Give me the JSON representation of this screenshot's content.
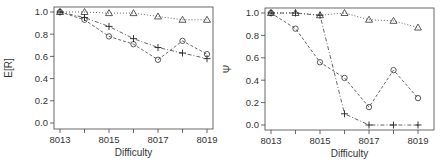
{
  "chart_data": [
    {
      "type": "line",
      "title": "",
      "xlabel": "Difficulty",
      "ylabel": "E[R]",
      "x": [
        8013,
        8014,
        8015,
        8016,
        8017,
        8018,
        8019
      ],
      "x_tick_labels": [
        "8013",
        "8015",
        "8017",
        "8019"
      ],
      "y_tick_labels": [
        "0.0",
        "0.2",
        "0.4",
        "0.6",
        "0.8",
        "1.0"
      ],
      "ylim": [
        0,
        1
      ],
      "grid": false,
      "legend": null,
      "series": [
        {
          "name": "triangle",
          "marker": "triangle",
          "linestyle": "dotted",
          "values": [
            1.0,
            1.0,
            0.99,
            0.99,
            0.96,
            0.93,
            0.93
          ]
        },
        {
          "name": "circle",
          "marker": "circle",
          "linestyle": "dashed",
          "values": [
            1.0,
            0.93,
            0.78,
            0.71,
            0.57,
            0.74,
            0.62
          ]
        },
        {
          "name": "plus",
          "marker": "plus",
          "linestyle": "dashdot",
          "values": [
            1.0,
            0.95,
            0.87,
            0.76,
            0.68,
            0.63,
            0.58
          ]
        }
      ]
    },
    {
      "type": "line",
      "title": "",
      "xlabel": "Difficulty",
      "ylabel": "Ψ",
      "x": [
        8013,
        8014,
        8015,
        8016,
        8017,
        8018,
        8019
      ],
      "x_tick_labels": [
        "8013",
        "8015",
        "8017",
        "8019"
      ],
      "y_tick_labels": [
        "0.0",
        "0.2",
        "0.4",
        "0.6",
        "0.8",
        "1.0"
      ],
      "ylim": [
        0,
        1
      ],
      "grid": false,
      "legend": null,
      "series": [
        {
          "name": "triangle",
          "marker": "triangle",
          "linestyle": "dotted",
          "values": [
            1.0,
            1.0,
            0.98,
            1.0,
            0.94,
            0.93,
            0.87
          ]
        },
        {
          "name": "circle",
          "marker": "circle",
          "linestyle": "dashed",
          "values": [
            1.0,
            0.86,
            0.56,
            0.42,
            0.16,
            0.49,
            0.24
          ]
        },
        {
          "name": "plus",
          "marker": "plus",
          "linestyle": "dashdot",
          "values": [
            1.0,
            1.0,
            0.98,
            0.1,
            0.0,
            0.0,
            0.0
          ]
        }
      ]
    }
  ]
}
